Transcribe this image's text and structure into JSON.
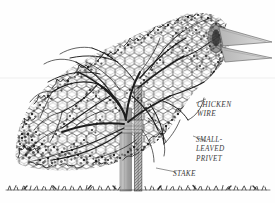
{
  "illustration": {
    "title": "Bird-shaped topiary trained on a chicken-wire frame",
    "subject": "topiary-bird",
    "style": "pen-and-ink line drawing",
    "background_color": "#fefefe",
    "ink_color": "#1c1c1c",
    "label_color": "#3c3c3c",
    "frame_fill": "#d0d0d0"
  },
  "labels": [
    {
      "id": "chicken-wire",
      "lines": [
        "CHICKEN",
        "WIRE"
      ],
      "text": "CHICKEN\nWIRE",
      "points_to": "wire-mesh-frame"
    },
    {
      "id": "small-leaved-privet",
      "lines": [
        "SMALL-",
        "LEAVED",
        "PRIVET"
      ],
      "text": "SMALL-\nLEAVED\nPRIVET",
      "points_to": "privet-foliage"
    },
    {
      "id": "stake",
      "lines": [
        "STAKE"
      ],
      "text": "STAKE",
      "points_to": "support-stake"
    }
  ],
  "parts": {
    "beak": "beak",
    "eye": "eye",
    "head": "head",
    "body": "body",
    "tail": "tail",
    "trunk": "trunk",
    "stake": "stake",
    "ground": "ground-line",
    "mesh": "hexagonal wire mesh"
  }
}
